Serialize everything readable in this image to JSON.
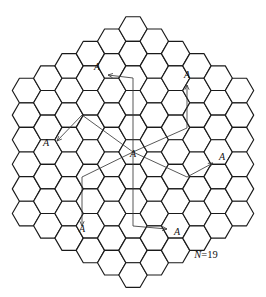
{
  "figure": {
    "name": "cellular-frequency-reuse-hexagon-grid",
    "caption": "N=19",
    "caption_symbol": "N",
    "caption_value": "=19",
    "cluster_size": 19,
    "shift_i": 3,
    "shift_j": 2,
    "colors": {
      "cell_stroke": "#1a1a1a",
      "cell_fill": "#ffffff",
      "path_stroke": "#3a3a3a",
      "label": "#111111",
      "background": "#ffffff"
    },
    "geometry": {
      "hex_orientation": "flat-top",
      "hex_radius": 14.2,
      "col_step": 21.3,
      "row_step": 24.6,
      "center_x": 133,
      "center_y": 152,
      "grid_rings": 5
    },
    "center_cell": {
      "label": "A",
      "x": 133,
      "y": 152,
      "label_x": 133,
      "label_y": 157
    },
    "cochannel_cells": [
      {
        "id": "cochannel-upper-left",
        "label": "A",
        "label_x": 97,
        "label_y": 70,
        "arrow_x": 108,
        "arrow_y": 75,
        "bend_x": 133,
        "bend_y": 78,
        "tail_x": 133,
        "tail_y": 152
      },
      {
        "id": "cochannel-upper-right",
        "label": "A",
        "label_x": 187,
        "label_y": 78,
        "arrow_x": 187,
        "arrow_y": 85,
        "bend_x": 187,
        "bend_y": 128,
        "tail_x": 133,
        "tail_y": 152
      },
      {
        "id": "cochannel-left",
        "label": "A",
        "label_x": 46,
        "label_y": 146,
        "arrow_x": 57,
        "arrow_y": 141,
        "bend_x": 82,
        "bend_y": 115,
        "tail_x": 133,
        "tail_y": 152
      },
      {
        "id": "cochannel-right",
        "label": "A",
        "label_x": 222,
        "label_y": 160,
        "arrow_x": 213,
        "arrow_y": 163,
        "bend_x": 187,
        "bend_y": 177,
        "tail_x": 133,
        "tail_y": 152
      },
      {
        "id": "cochannel-lower-left",
        "label": "A",
        "label_x": 82,
        "label_y": 232,
        "arrow_x": 82,
        "arrow_y": 226,
        "bend_x": 82,
        "bend_y": 177,
        "tail_x": 133,
        "tail_y": 152
      },
      {
        "id": "cochannel-lower-right",
        "label": "A",
        "label_x": 177,
        "label_y": 235,
        "arrow_x": 167,
        "arrow_y": 229,
        "bend_x": 133,
        "bend_y": 226,
        "tail_x": 133,
        "tail_y": 152
      }
    ]
  }
}
